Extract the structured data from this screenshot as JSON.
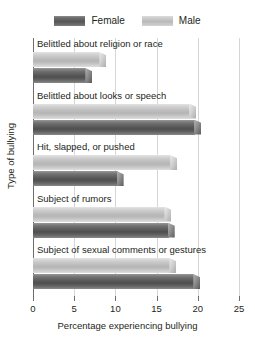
{
  "chart_data": {
    "type": "bar",
    "orientation": "horizontal",
    "title": "",
    "xlabel": "Percentage experiencing bullying",
    "ylabel": "Type of bullying",
    "xlim": [
      0,
      25
    ],
    "xticks": [
      0,
      5,
      10,
      15,
      20,
      25
    ],
    "xtick_labels": [
      "0",
      "5",
      "10",
      "15",
      "20",
      "25"
    ],
    "grid": "vertical",
    "legend_position": "top-center",
    "categories": [
      "Belittled about religion or race",
      "Belittled about looks or speech",
      "Hit, slapped, or pushed",
      "Subject of rumors",
      "Subject of sexual comments or gestures"
    ],
    "series": [
      {
        "name": "Female",
        "color": "#5a5a5a",
        "values": [
          7.2,
          20.4,
          11.0,
          17.2,
          20.3
        ]
      },
      {
        "name": "Male",
        "color": "#c0c0c0",
        "values": [
          8.9,
          19.8,
          17.5,
          16.8,
          17.4
        ]
      }
    ]
  },
  "legend": {
    "entries": [
      {
        "label": "Female",
        "swatch": "female-swatch"
      },
      {
        "label": "Male",
        "swatch": "male-swatch"
      }
    ]
  },
  "axes": {
    "x_title": "Percentage experiencing bullying",
    "y_title": "Type of bullying",
    "x_tick_labels": [
      "0",
      "5",
      "10",
      "15",
      "20",
      "25"
    ]
  },
  "colors": {
    "female": "#5a5a5a",
    "male": "#c0c0c0",
    "axis": "#6d6d6d",
    "gridline": "#d6d6d6",
    "text": "#231f20",
    "background": "#ffffff"
  }
}
